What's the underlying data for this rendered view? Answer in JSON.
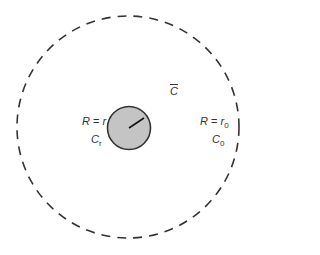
{
  "diagram": {
    "outer_region_label": "C",
    "inner_circle": {
      "radius_label_lhs": "R",
      "radius_label_rhs": "r",
      "name": "C",
      "name_sub": "r",
      "fill": "#c4c4c4",
      "stroke": "#333333"
    },
    "outer_circle": {
      "radius_label_lhs": "R",
      "radius_label_rhs": "r",
      "radius_label_sub": "0",
      "name": "C",
      "name_sub": "0",
      "style": "dashed",
      "stroke": "#333333"
    },
    "equals": "="
  }
}
